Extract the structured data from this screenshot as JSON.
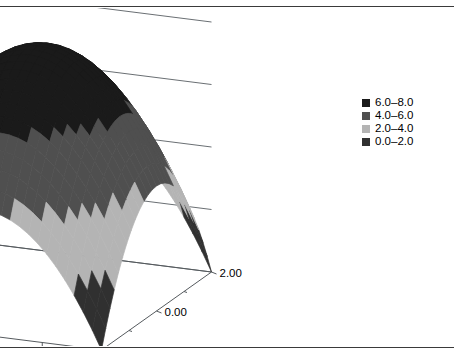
{
  "title": "",
  "frame": {
    "border_color": "#3a3a3a"
  },
  "legend": {
    "position": "right",
    "items": [
      {
        "label": "6.0–8.0",
        "color": "#1a1a1a",
        "range": [
          6.0,
          8.0
        ]
      },
      {
        "label": "4.0–6.0",
        "color": "#4f4f4f",
        "range": [
          4.0,
          6.0
        ]
      },
      {
        "label": "2.0–4.0",
        "color": "#b4b4b4",
        "range": [
          2.0,
          4.0
        ]
      },
      {
        "label": "0.0–2.0",
        "color": "#303030",
        "range": [
          0.0,
          2.0
        ]
      }
    ]
  },
  "chart_data": {
    "type": "surface",
    "title": "",
    "xlabel": "",
    "ylabel": "",
    "zlabel": "",
    "projection": "3d-wireframe-surface",
    "x": [
      -2.0,
      -1.5,
      -1.0,
      -0.5,
      0.0,
      0.5,
      1.0,
      1.5,
      2.0
    ],
    "y": [
      -2.0,
      -1.5,
      -1.0,
      -0.5,
      0.0,
      0.5,
      1.0,
      1.5,
      2.0
    ],
    "z_formula": "z = 8 - x^2 - y^2 (clamped at 0)",
    "z": [
      [
        0.0,
        1.75,
        3.0,
        3.75,
        4.0,
        3.75,
        3.0,
        1.75,
        0.0
      ],
      [
        1.75,
        3.5,
        4.75,
        5.5,
        5.75,
        5.5,
        4.75,
        3.5,
        1.75
      ],
      [
        3.0,
        4.75,
        6.0,
        6.75,
        7.0,
        6.75,
        6.0,
        4.75,
        3.0
      ],
      [
        3.75,
        5.5,
        6.75,
        7.5,
        7.75,
        7.5,
        6.75,
        5.5,
        3.75
      ],
      [
        4.0,
        5.75,
        7.0,
        7.75,
        8.0,
        7.75,
        7.0,
        5.75,
        4.0
      ],
      [
        3.75,
        5.5,
        6.75,
        7.5,
        7.75,
        7.5,
        6.75,
        5.5,
        3.75
      ],
      [
        3.0,
        4.75,
        6.0,
        6.75,
        7.0,
        6.75,
        6.0,
        4.75,
        3.0
      ],
      [
        1.75,
        3.5,
        4.75,
        5.5,
        5.75,
        5.5,
        4.75,
        3.5,
        1.75
      ],
      [
        0.0,
        1.75,
        3.0,
        3.75,
        4.0,
        3.75,
        3.0,
        1.75,
        0.0
      ]
    ],
    "zlim": [
      0.0,
      8.0
    ],
    "xlim": [
      -2.0,
      2.0
    ],
    "ylim": [
      -2.0,
      2.0
    ],
    "grid": true,
    "legend_position": "right",
    "bands": [
      {
        "label": "6.0–8.0",
        "min": 6.0,
        "max": 8.0,
        "color": "#1a1a1a"
      },
      {
        "label": "4.0–6.0",
        "min": 4.0,
        "max": 6.0,
        "color": "#4f4f4f"
      },
      {
        "label": "2.0–4.0",
        "min": 2.0,
        "max": 4.0,
        "color": "#b4b4b4"
      },
      {
        "label": "0.0–2.0",
        "min": 0.0,
        "max": 2.0,
        "color": "#303030"
      }
    ],
    "z_axis": {
      "ticks": [
        0.0,
        2.0,
        4.0,
        6.0,
        8.0
      ],
      "tick_labels": [
        "0.0",
        "2.0",
        "4.0",
        "6.0",
        "8.0"
      ]
    },
    "x_axis": {
      "ticks": [
        -2.0,
        0.0,
        2.0
      ],
      "tick_labels": [
        "−2.00",
        "0.00",
        "2.00"
      ]
    },
    "y_axis": {
      "ticks": [
        -2.0,
        0.0,
        2.0
      ],
      "tick_labels": [
        "−2.00",
        "0.00",
        "2.00"
      ]
    }
  },
  "axis_labels": {
    "z": [
      "8.0",
      "6.0",
      "4.0",
      "2.0",
      "0.0"
    ],
    "x": [
      "−2.00",
      "0.00",
      "2.00"
    ],
    "y": [
      "2.00",
      "0.00",
      "−2.00"
    ]
  }
}
